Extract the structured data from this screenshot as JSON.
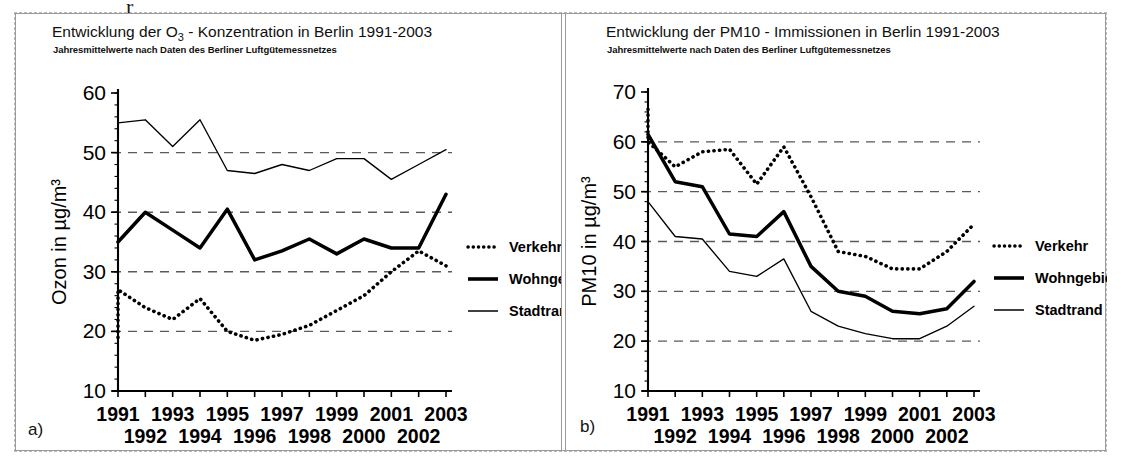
{
  "scan_fragment": "r",
  "panels": [
    {
      "key": "a",
      "label": "a)",
      "title": "Entwicklung der O₃ - Konzentration  in Berlin 1991-2003",
      "subtitle": "Jahresmittelwerte nach Daten des Berliner Luftgütemessnetzes"
    },
    {
      "key": "b",
      "label": "b)",
      "title": "Entwicklung der PM10 - Immissionen  in Berlin 1991-2003",
      "subtitle": "Jahresmittelwerte nach Daten des Berliner Luftgütemessnetzes"
    }
  ],
  "legend": {
    "items": [
      {
        "label": "Verkehr",
        "style": "dotted",
        "color": "#000000"
      },
      {
        "label": "Wohngebiet",
        "style": "thick-solid",
        "color": "#000000"
      },
      {
        "label": "Stadtrand",
        "style": "thin-solid",
        "color": "#000000"
      }
    ]
  },
  "chart_data": [
    {
      "panel": "a",
      "type": "line",
      "title": "Entwicklung der O3 - Konzentration in Berlin 1991-2003",
      "subtitle": "Jahresmittelwerte nach Daten des Berliner Luftgütemessnetzes",
      "xlabel": "",
      "ylabel": "Ozon in µg/m³",
      "x": [
        1991,
        1992,
        1993,
        1994,
        1995,
        1996,
        1997,
        1998,
        1999,
        2000,
        2001,
        2002,
        2003
      ],
      "categories": [
        "1991",
        "1992",
        "1993",
        "1994",
        "1995",
        "1996",
        "1997",
        "1998",
        "1999",
        "2000",
        "2001",
        "2002",
        "2003"
      ],
      "xticklabels_row1": [
        "1991",
        "1993",
        "1995",
        "1997",
        "1999",
        "2001",
        "2003"
      ],
      "xticklabels_row2": [
        "1992",
        "1994",
        "1996",
        "1998",
        "2000",
        "2002"
      ],
      "ylim": [
        10,
        60
      ],
      "yticks": [
        10,
        20,
        30,
        40,
        50,
        60
      ],
      "gridlines": [
        20,
        30,
        40,
        50
      ],
      "grid": true,
      "legend_position": "right",
      "series": [
        {
          "name": "Verkehr",
          "style": "dotted",
          "values": [
            19.0,
            27.0,
            24.0,
            22.0,
            25.5,
            20.0,
            18.5,
            19.5,
            21.0,
            23.5,
            26.0,
            30.0,
            33.5,
            31.0
          ]
        },
        {
          "name": "Wohngebiet",
          "style": "thick-solid",
          "values": [
            35.0,
            40.0,
            37.0,
            34.0,
            40.5,
            32.0,
            33.5,
            35.5,
            33.0,
            35.5,
            34.0,
            34.0,
            43.0
          ]
        },
        {
          "name": "Stadtrand",
          "style": "thin-solid",
          "values": [
            55.0,
            55.5,
            51.0,
            55.5,
            47.0,
            46.5,
            48.0,
            47.0,
            49.0,
            49.0,
            45.5,
            48.0,
            50.5
          ]
        }
      ]
    },
    {
      "panel": "b",
      "type": "line",
      "title": "Entwicklung der PM10 - Immissionen in Berlin 1991-2003",
      "subtitle": "Jahresmittelwerte nach Daten des Berliner Luftgütemessnetzes",
      "xlabel": "",
      "ylabel": "PM10 in µg/m³",
      "x": [
        1991,
        1992,
        1993,
        1994,
        1995,
        1996,
        1997,
        1998,
        1999,
        2000,
        2001,
        2002,
        2003
      ],
      "categories": [
        "1991",
        "1992",
        "1993",
        "1994",
        "1995",
        "1996",
        "1997",
        "1998",
        "1999",
        "2000",
        "2001",
        "2002",
        "2003"
      ],
      "xticklabels_row1": [
        "1991",
        "1993",
        "1995",
        "1997",
        "1999",
        "2001",
        "2003"
      ],
      "xticklabels_row2": [
        "1992",
        "1994",
        "1996",
        "1998",
        "2000",
        "2002"
      ],
      "ylim": [
        10,
        70
      ],
      "yticks": [
        10,
        20,
        30,
        40,
        50,
        60,
        70
      ],
      "gridlines": [
        20,
        30,
        40,
        50,
        60
      ],
      "grid": true,
      "legend_position": "right",
      "series": [
        {
          "name": "Verkehr",
          "style": "dotted",
          "values": [
            66.5,
            60.0,
            55.0,
            58.0,
            58.5,
            51.5,
            59.0,
            49.0,
            38.0,
            37.0,
            34.5,
            34.5,
            38.0,
            43.5
          ]
        },
        {
          "name": "Wohngebiet",
          "style": "thick-solid",
          "values": [
            61.5,
            52.0,
            51.0,
            41.5,
            41.0,
            46.0,
            35.0,
            30.0,
            29.0,
            26.0,
            25.5,
            26.5,
            32.0
          ]
        },
        {
          "name": "Stadtrand",
          "style": "thin-solid",
          "values": [
            48.0,
            41.0,
            40.5,
            34.0,
            33.0,
            36.5,
            26.0,
            23.0,
            21.5,
            20.5,
            20.5,
            23.0,
            27.0
          ]
        }
      ]
    }
  ]
}
